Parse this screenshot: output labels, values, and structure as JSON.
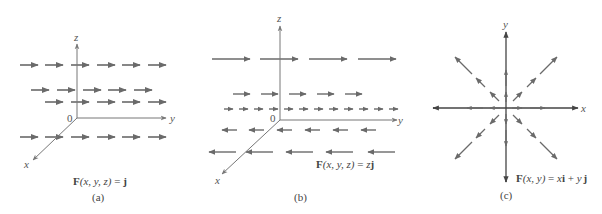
{
  "figure": {
    "colors": {
      "arrow": "#6a6a6a",
      "axis": "#777777",
      "axis_dark": "#444444",
      "text": "#444444"
    },
    "panels": [
      {
        "id": "a",
        "tag": "(a)",
        "axis_labels": {
          "z": "z",
          "y": "y",
          "x": "x",
          "origin": "0"
        },
        "caption_parts": {
          "F": "F",
          "args": "(x, y, z)",
          "eq": " = ",
          "rhs": "j"
        }
      },
      {
        "id": "b",
        "tag": "(b)",
        "axis_labels": {
          "z": "z",
          "y": "y",
          "x": "x",
          "origin": "0"
        },
        "caption_parts": {
          "F": "F",
          "args": "(x, y, z)",
          "eq": " = ",
          "rhs_scalar": "z",
          "rhs": "j"
        }
      },
      {
        "id": "c",
        "tag": "(c)",
        "axis_labels": {
          "x": "x",
          "y": "y"
        },
        "caption_parts": {
          "F": "F",
          "args": "(x, y)",
          "eq": " = ",
          "t1": "x",
          "i": "i",
          "plus": " + ",
          "t2": "y",
          "j": "j"
        }
      }
    ]
  }
}
